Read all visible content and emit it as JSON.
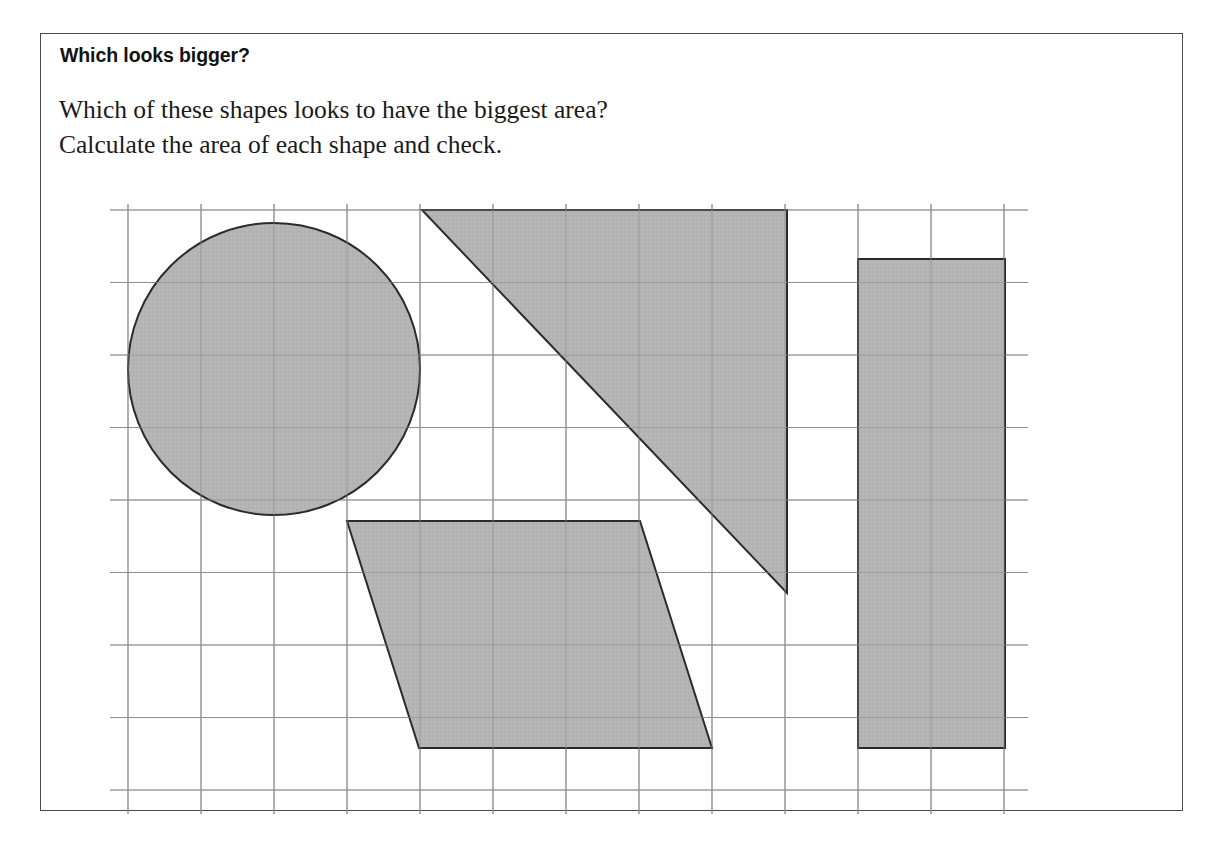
{
  "page": {
    "title": "Which looks bigger?",
    "body_lines": [
      "Which of these shapes looks to have the biggest area?",
      "Calculate the area of each shape and check."
    ],
    "border_color": "#4a4a4a",
    "background_color": "#ffffff",
    "text_color": "#1a1a1a"
  },
  "figure": {
    "name": "area-comparison-grid",
    "shape_fill_color": "#b4b4b4",
    "shape_stroke_color": "#2b2b2b",
    "grid_line_color": "#8f8f8f",
    "grid": {
      "origin_x": 128,
      "origin_y": 210,
      "cell_width": 73,
      "cell_height": 72.5,
      "columns": 12,
      "rows": 8,
      "overhang": 24
    },
    "shapes": [
      {
        "name": "circle",
        "label": "Circle",
        "type": "circle",
        "center_x": 274,
        "center_y": 369,
        "radius": 146,
        "grid_diameter_cells": 4
      },
      {
        "name": "triangle",
        "label": "Right-angled triangle",
        "type": "polygon",
        "points": "422,210 787,210 787,593",
        "grid_base_cells": 5,
        "grid_height_cells": 5.3
      },
      {
        "name": "parallelogram",
        "label": "Parallelogram",
        "type": "polygon",
        "points": "347,521 640,521 712,748 419,748",
        "grid_base_cells": 4,
        "grid_height_cells": 3.1
      },
      {
        "name": "rectangle",
        "label": "Rectangle",
        "type": "rect",
        "x": 858,
        "y": 259,
        "width": 147,
        "height": 489,
        "grid_width_cells": 2,
        "grid_height_cells": 6.7
      }
    ]
  }
}
